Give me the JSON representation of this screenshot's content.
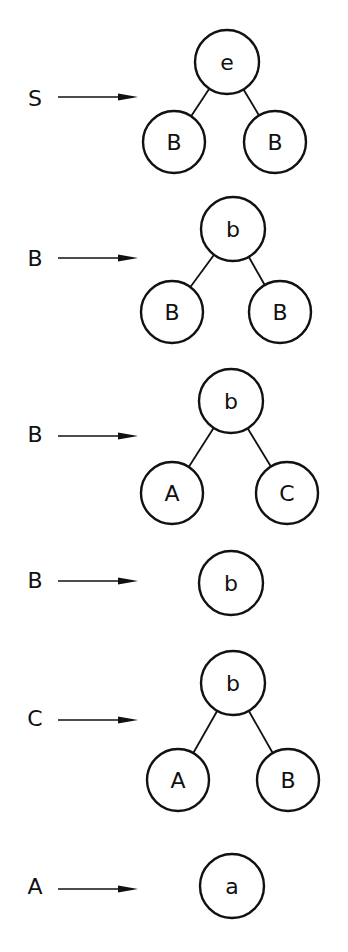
{
  "rules": [
    {
      "lhs": "S",
      "tree": {
        "label": "e",
        "children": [
          {
            "label": "B"
          },
          {
            "label": "B"
          }
        ]
      }
    },
    {
      "lhs": "B",
      "tree": {
        "label": "b",
        "children": [
          {
            "label": "B"
          },
          {
            "label": "B"
          }
        ]
      }
    },
    {
      "lhs": "B",
      "tree": {
        "label": "b",
        "children": [
          {
            "label": "A"
          },
          {
            "label": "C"
          }
        ]
      }
    },
    {
      "lhs": "B",
      "tree": {
        "label": "b",
        "children": []
      }
    },
    {
      "lhs": "C",
      "tree": {
        "label": "b",
        "children": [
          {
            "label": "A"
          },
          {
            "label": "B"
          }
        ]
      }
    },
    {
      "lhs": "A",
      "tree": {
        "label": "a",
        "children": []
      }
    }
  ]
}
